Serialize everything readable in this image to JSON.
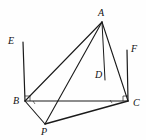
{
  "figure": {
    "kind": "geometry-diagram",
    "canvas": {
      "width": 146,
      "height": 140
    },
    "background_color": "#fefefe",
    "line_color": "#1a1a1a",
    "label_color": "#111111",
    "points": [
      {
        "name": "A",
        "label": "A",
        "x": 102,
        "y": 22,
        "label_x": 98,
        "label_y": 8
      },
      {
        "name": "B",
        "label": "B",
        "x": 25,
        "y": 101,
        "label_x": 13,
        "label_y": 96
      },
      {
        "name": "C",
        "label": "C",
        "x": 128,
        "y": 101,
        "label_x": 133,
        "label_y": 98
      },
      {
        "name": "D",
        "label": "D",
        "x": 105,
        "y": 80,
        "label_x": 95,
        "label_y": 70
      },
      {
        "name": "E",
        "label": "E",
        "x": 23,
        "y": 42,
        "label_x": 8,
        "label_y": 36
      },
      {
        "name": "F",
        "label": "F",
        "x": 127,
        "y": 50,
        "label_x": 131,
        "label_y": 44
      },
      {
        "name": "P",
        "label": "P",
        "x": 45,
        "y": 124,
        "label_x": 41,
        "label_y": 127
      }
    ],
    "segments": [
      {
        "name": "segment-AB",
        "from": "A",
        "to": "B",
        "width": 1.1
      },
      {
        "name": "segment-AC",
        "from": "A",
        "to": "C",
        "width": 1.1
      },
      {
        "name": "segment-AP",
        "from": "A",
        "to": "P",
        "width": 1.1
      },
      {
        "name": "segment-AD",
        "from": "A",
        "to": "D",
        "width": 1.0
      },
      {
        "name": "segment-BC",
        "from": "B",
        "to": "C",
        "width": 1.0
      },
      {
        "name": "segment-BP",
        "from": "B",
        "to": "P",
        "width": 1.1
      },
      {
        "name": "segment-PC",
        "from": "P",
        "to": "C",
        "width": 1.3
      },
      {
        "name": "segment-BE",
        "from": "B",
        "to": "E",
        "width": 1.2
      },
      {
        "name": "segment-CF",
        "from": "C",
        "to": "F",
        "width": 1.2
      }
    ],
    "right_angle_marks": [
      {
        "name": "right-angle-at-B-between-BE-and-BC",
        "x": 25,
        "y": 101,
        "size": 5,
        "dir_x": 1,
        "dir_y": -1
      },
      {
        "name": "right-angle-at-C-between-CF-and-CB",
        "x": 128,
        "y": 101,
        "size": 5,
        "dir_x": -1,
        "dir_y": -1
      }
    ],
    "tick_marks": [
      {
        "name": "tick-on-BC-near-B",
        "x": 33,
        "y": 103
      },
      {
        "name": "tick-on-BC-near-C",
        "x": 110,
        "y": 102
      }
    ]
  }
}
